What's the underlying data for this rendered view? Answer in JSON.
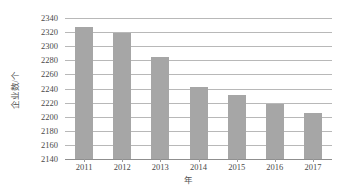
{
  "chart_data": {
    "type": "bar",
    "title": "",
    "subtitle": "",
    "xlabel": "年",
    "ylabel": "企业数/个",
    "categories": [
      "2011",
      "2012",
      "2013",
      "2014",
      "2015",
      "2016",
      "2017"
    ],
    "values": [
      2327,
      2319,
      2285,
      2242,
      2231,
      2218,
      2205
    ],
    "series": [
      {
        "name": "企业数",
        "values": [
          2327,
          2319,
          2285,
          2242,
          2231,
          2218,
          2205
        ]
      }
    ],
    "ylim": [
      2140,
      2340
    ],
    "ytick_step": 20,
    "yticks": [
      2340,
      2320,
      2300,
      2280,
      2260,
      2240,
      2220,
      2200,
      2180,
      2160,
      2140
    ],
    "ytick_labels": [
      "2340",
      "2320",
      "2300",
      "2280",
      "2260",
      "2240",
      "2220",
      "2200",
      "2180",
      "2160",
      "2140"
    ],
    "grid": true,
    "grid_axis": "y",
    "legend": false,
    "legend_position": "none",
    "annotations": [],
    "colors": {
      "bar_fill": "#a6a6a6",
      "gridline": "#b8b8b8",
      "axis_line": "#8f8f8f",
      "tick_text": "#4a4a4a",
      "axis_title_text": "#555555",
      "background": "#ffffff"
    }
  }
}
